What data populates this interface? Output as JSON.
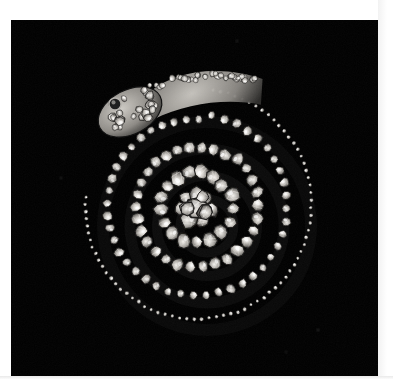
{
  "image": {
    "kind": "photograph",
    "subject": "diamond-set coiled serpent jewel",
    "description": "Black and white photograph of an antique diamond serpent jewel coiled in a flat spiral, head at upper left, tail tapering around the outside, photographed against a plain black background.",
    "orientation": "square",
    "color_mode": "monochrome",
    "background_color": "#000000",
    "border_color": "#ffffff",
    "photo_left": 11,
    "photo_top": 20,
    "photo_width": 367,
    "photo_height": 356
  },
  "subject": {
    "object_name": "serpent jewel",
    "material": "diamonds in silver-topped mounts",
    "form": "flat spiral coil",
    "coil_turns": 2.5,
    "head_position": "upper-left",
    "tail_position": "outer-right",
    "center_x": 196,
    "center_y": 206,
    "eye_count": 1
  },
  "palette": {
    "background": "#000000",
    "stone_highlight": "#f4f2ee",
    "stone_midtone": "#b9b6b1",
    "stone_shadow": "#55524e",
    "setting_dark": "#151515",
    "matte_white": "#ffffff"
  },
  "coils": [
    {
      "name": "outer-tail-coil",
      "radius": 118,
      "stone_size": 4.0,
      "stone_count": 96,
      "brightness": 0.72
    },
    {
      "name": "second-coil",
      "radius": 92,
      "stone_size": 9.5,
      "stone_count": 44,
      "brightness": 0.92
    },
    {
      "name": "third-coil",
      "radius": 63,
      "stone_size": 12.5,
      "stone_count": 30,
      "brightness": 1.0
    },
    {
      "name": "inner-coil",
      "radius": 38,
      "stone_size": 14.5,
      "stone_count": 17,
      "brightness": 1.0
    },
    {
      "name": "center-cluster",
      "radius": 16,
      "stone_size": 16.0,
      "stone_count": 7,
      "brightness": 1.0
    }
  ],
  "head": {
    "label": "serpent head",
    "cx": 130,
    "cy": 112,
    "rx": 34,
    "ry": 22,
    "rotation_deg": -28,
    "pave_stone_count": 26,
    "eye_cx": 115,
    "eye_cy": 104,
    "eye_r": 6
  },
  "specks": [
    {
      "x": 318,
      "y": 330,
      "r": 1.2
    },
    {
      "x": 286,
      "y": 352,
      "r": 1.0
    },
    {
      "x": 237,
      "y": 41,
      "r": 1.0
    },
    {
      "x": 61,
      "y": 178,
      "r": 1.0
    }
  ],
  "caption": {
    "alt_text": "Antique diamond serpent jewel coiled in a spiral, photographed on black"
  }
}
